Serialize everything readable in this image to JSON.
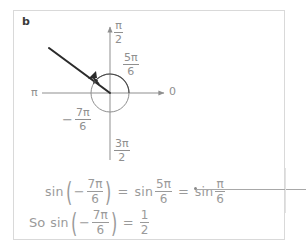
{
  "worksheet": {
    "part_label": "b",
    "panel_border_color": "#d9d9d9",
    "ink_color": "#9a9a9a",
    "diagram_ink_color": "#8f8f8f",
    "ray_color": "#2b2b2b"
  },
  "diagram": {
    "name": "unit-circle-angle-diagram",
    "origin": {
      "x": 110,
      "y": 93
    },
    "circle_radius": 19,
    "axis_labels": {
      "top": {
        "num": "π",
        "den": "2"
      },
      "bottom": {
        "num": "3π",
        "den": "2"
      },
      "left": "π",
      "right": "0"
    },
    "angle_labels": [
      {
        "id": "five-pi-over-six",
        "sign": "",
        "num": "5π",
        "den": "6"
      },
      {
        "id": "negative-seven-pi-over-six",
        "sign": "−",
        "num": "7π",
        "den": "6"
      }
    ],
    "ray": {
      "start_x": 49,
      "start_y": 48,
      "end_x": 110,
      "end_y": 93,
      "angle_deg": 150
    },
    "arcs": [
      {
        "id": "arc-five-pi-over-six",
        "from_deg": 0,
        "to_deg": 150,
        "radius": 19
      }
    ]
  },
  "equations": {
    "line1": {
      "fn1": "sin",
      "open": "(",
      "sign": "−",
      "frac1": {
        "num": "7π",
        "den": "6"
      },
      "close": ")",
      "eq1": "=",
      "fn2": "sin",
      "frac2": {
        "num": "5π",
        "den": "6"
      },
      "eq2": "=",
      "fn3": "sin",
      "frac3": {
        "num": "π",
        "den": "6"
      }
    },
    "line2": {
      "so": "So",
      "fn1": "sin",
      "open": "(",
      "sign": "−",
      "frac1": {
        "num": "7π",
        "den": "6"
      },
      "close": ")",
      "eq1": "=",
      "result": {
        "num": "1",
        "den": "2"
      }
    }
  },
  "annotation": {
    "pointer_line_label": "callout-leader-line"
  }
}
